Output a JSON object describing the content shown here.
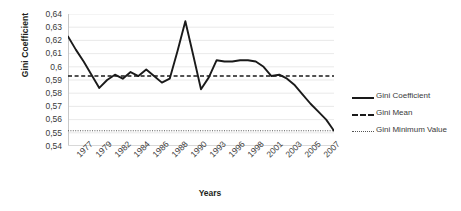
{
  "chart_data": {
    "type": "line",
    "title": "",
    "xlabel": "Years",
    "ylabel": "Gini Coefficient",
    "ylim": [
      0.54,
      0.64
    ],
    "ytick_labels": [
      "0,64",
      "0,63",
      "0,62",
      "0,61",
      "0,6",
      "0,59",
      "0,58",
      "0,57",
      "0,56",
      "0,55",
      "0,54"
    ],
    "ytick_values": [
      0.64,
      0.63,
      0.62,
      0.61,
      0.6,
      0.59,
      0.58,
      0.57,
      0.56,
      0.55,
      0.54
    ],
    "xtick_labels": [
      "1977",
      "1979",
      "1982",
      "1984",
      "1986",
      "1988",
      "1990",
      "1993",
      "1996",
      "1998",
      "2001",
      "2003",
      "2005",
      "2007"
    ],
    "grid": "horizontal",
    "legend_position": "right",
    "decimal_separator": ",",
    "x": [
      1977,
      1978,
      1979,
      1980,
      1981,
      1982,
      1983,
      1984,
      1985,
      1986,
      1987,
      1988,
      1989,
      1990,
      1991,
      1992,
      1993,
      1994,
      1995,
      1996,
      1997,
      1998,
      1999,
      2000,
      2001,
      2002,
      2003,
      2004,
      2005,
      2006,
      2007
    ],
    "series": [
      {
        "name": "Gini Coefficient",
        "style": "solid",
        "color": "#1a1a1a",
        "values": [
          0.623,
          0.613,
          0.604,
          0.594,
          0.584,
          0.59,
          0.594,
          0.591,
          0.596,
          0.593,
          0.598,
          0.593,
          0.588,
          0.591,
          0.612,
          0.6345,
          0.609,
          0.583,
          0.592,
          0.605,
          0.604,
          0.604,
          0.605,
          0.605,
          0.604,
          0.6,
          0.593,
          0.594,
          0.591,
          0.586,
          0.579
        ]
      },
      {
        "name": "Gini Mean",
        "style": "dashed",
        "color": "#1a1a1a",
        "constant": 0.593
      },
      {
        "name": "Gini Minimum Value",
        "style": "dotted",
        "color": "#555555",
        "constant": 0.5515
      }
    ],
    "tail": {
      "note": "continuation of Gini Coefficient after 2007 tick on axis",
      "values": [
        0.572,
        0.566,
        0.56,
        0.5515
      ]
    },
    "annotations": []
  },
  "legend": {
    "items": [
      {
        "label": "Gini Coefficient",
        "key": "solid-line-key"
      },
      {
        "label": "Gini Mean",
        "key": "dashed-line-key"
      },
      {
        "label": "Gini Minimum Value",
        "key": "dotted-line-key"
      }
    ]
  }
}
